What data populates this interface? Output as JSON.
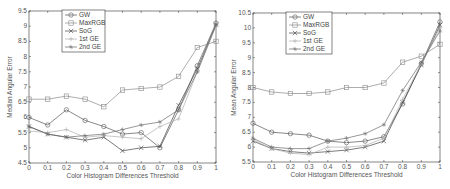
{
  "chart_data": [
    {
      "type": "line",
      "title": "",
      "xlabel": "Color Histogram Differences Threshold",
      "ylabel": "Median Angular Error",
      "x": [
        0,
        0.1,
        0.2,
        0.3,
        0.4,
        0.5,
        0.6,
        0.7,
        0.8,
        0.9,
        1
      ],
      "xticks": [
        "0",
        "0.1",
        "0.2",
        "0.3",
        "0.4",
        "0.5",
        "0.6",
        "0.7",
        "0.8",
        "0.9",
        "1"
      ],
      "yticks": [
        "4.5",
        "5",
        "5.5",
        "6",
        "6.5",
        "7",
        "7.5",
        "8",
        "8.5",
        "9",
        "9.5"
      ],
      "ylim": [
        4.5,
        9.5
      ],
      "xlim": [
        0,
        1
      ],
      "legend_position": "upper left",
      "series": [
        {
          "name": "GW",
          "marker": "o",
          "values": [
            6.0,
            5.75,
            6.25,
            5.9,
            5.7,
            5.45,
            5.5,
            5.0,
            6.25,
            7.7,
            9.1
          ]
        },
        {
          "name": "MaxRGB",
          "marker": "s",
          "values": [
            6.6,
            6.6,
            6.7,
            6.6,
            6.35,
            6.9,
            6.95,
            7.0,
            7.35,
            8.3,
            8.5
          ]
        },
        {
          "name": "SoG",
          "marker": "x",
          "values": [
            5.7,
            5.45,
            5.35,
            5.25,
            5.35,
            4.9,
            5.0,
            5.05,
            6.4,
            7.6,
            9.05
          ]
        },
        {
          "name": "1st GE",
          "marker": "+",
          "values": [
            5.55,
            5.5,
            5.6,
            5.35,
            5.4,
            5.35,
            5.3,
            5.7,
            5.95,
            7.5,
            9.0
          ]
        },
        {
          "name": "2nd GE",
          "marker": "*",
          "values": [
            5.7,
            5.45,
            5.35,
            5.4,
            5.45,
            5.6,
            5.75,
            5.85,
            6.25,
            7.5,
            9.05
          ]
        }
      ]
    },
    {
      "type": "line",
      "title": "",
      "xlabel": "Color Histogram Differences Threshold",
      "ylabel": "Mean Angular Error",
      "x": [
        0,
        0.1,
        0.2,
        0.3,
        0.4,
        0.5,
        0.6,
        0.7,
        0.8,
        0.9,
        1
      ],
      "xticks": [
        "0",
        "0.1",
        "0.2",
        "0.3",
        "0.4",
        "0.5",
        "0.6",
        "0.7",
        "0.8",
        "0.9",
        "1"
      ],
      "yticks": [
        "5.5",
        "6",
        "6.5",
        "7",
        "7.5",
        "8",
        "8.5",
        "9",
        "9.5",
        "10",
        "10.5"
      ],
      "ylim": [
        5.5,
        10.5
      ],
      "xlim": [
        0,
        1
      ],
      "legend_position": "upper left",
      "series": [
        {
          "name": "GW",
          "marker": "o",
          "values": [
            6.8,
            6.5,
            6.45,
            6.4,
            6.2,
            6.15,
            6.2,
            6.35,
            7.45,
            8.8,
            10.2
          ]
        },
        {
          "name": "MaxRGB",
          "marker": "s",
          "values": [
            8.0,
            7.85,
            7.8,
            7.8,
            7.85,
            8.0,
            8.0,
            8.15,
            8.85,
            9.05,
            9.45
          ]
        },
        {
          "name": "SoG",
          "marker": "x",
          "values": [
            6.2,
            5.95,
            5.85,
            5.8,
            5.85,
            5.9,
            6.0,
            6.2,
            7.5,
            8.75,
            10.1
          ]
        },
        {
          "name": "1st GE",
          "marker": "+",
          "values": [
            6.25,
            5.95,
            5.8,
            5.75,
            6.0,
            6.0,
            6.05,
            6.3,
            7.6,
            8.8,
            10.0
          ]
        },
        {
          "name": "2nd GE",
          "marker": "*",
          "values": [
            6.3,
            6.0,
            5.95,
            5.95,
            6.2,
            6.3,
            6.45,
            6.75,
            7.9,
            8.85,
            9.9
          ]
        }
      ]
    }
  ],
  "styles": {
    "series_colors": [
      "#555555",
      "#8a8a8a",
      "#444444",
      "#b0b0b0",
      "#6a6a6a"
    ],
    "axis_color": "#333333"
  },
  "layout": [
    {
      "x0": 29,
      "x1": 216,
      "y0": 163,
      "y1": 11,
      "legend": {
        "x": 62,
        "y": 10,
        "w": 43,
        "h": 42
      }
    },
    {
      "x0": 253,
      "x1": 440,
      "y0": 162,
      "y1": 13,
      "legend": {
        "x": 286,
        "y": 12,
        "w": 46,
        "h": 42
      }
    }
  ]
}
